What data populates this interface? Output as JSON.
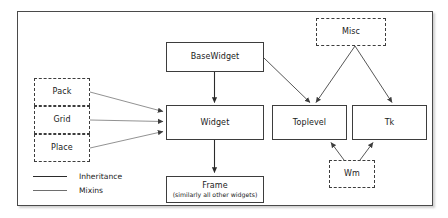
{
  "diagram": {
    "background_color": "#ffffff",
    "border_color": "#4a4a4a",
    "solid_line_color": "#2b2b2b",
    "mixin_line_color": "#6e6e6e"
  },
  "nodes": {
    "basewidget": {
      "label": "BaseWidget",
      "style": "solid"
    },
    "widget": {
      "label": "Widget",
      "style": "solid"
    },
    "frame": {
      "label": "Frame",
      "sublabel": "(similarly all other widgets)",
      "style": "solid"
    },
    "toplevel": {
      "label": "Toplevel",
      "style": "solid"
    },
    "tk": {
      "label": "Tk",
      "style": "solid"
    },
    "misc": {
      "label": "Misc",
      "style": "dashed"
    },
    "wm": {
      "label": "Wm",
      "style": "dashed"
    },
    "pack": {
      "label": "Pack",
      "style": "dashed"
    },
    "grid": {
      "label": "Grid",
      "style": "dashed"
    },
    "place": {
      "label": "Place",
      "style": "dashed"
    }
  },
  "legend": {
    "items": [
      {
        "label": "Inheritance",
        "line": "thick"
      },
      {
        "label": "Mixins",
        "line": "thin"
      }
    ]
  },
  "edges": [
    {
      "from": "basewidget",
      "to": "widget",
      "kind": "inheritance"
    },
    {
      "from": "basewidget",
      "to": "toplevel",
      "kind": "inheritance"
    },
    {
      "from": "widget",
      "to": "frame",
      "kind": "inheritance"
    },
    {
      "from": "misc",
      "to": "toplevel",
      "kind": "inheritance"
    },
    {
      "from": "misc",
      "to": "tk",
      "kind": "inheritance"
    },
    {
      "from": "wm",
      "to": "toplevel",
      "kind": "mixins"
    },
    {
      "from": "wm",
      "to": "tk",
      "kind": "mixins"
    },
    {
      "from": "pack",
      "to": "widget",
      "kind": "mixins"
    },
    {
      "from": "grid",
      "to": "widget",
      "kind": "mixins"
    },
    {
      "from": "place",
      "to": "widget",
      "kind": "mixins"
    }
  ]
}
